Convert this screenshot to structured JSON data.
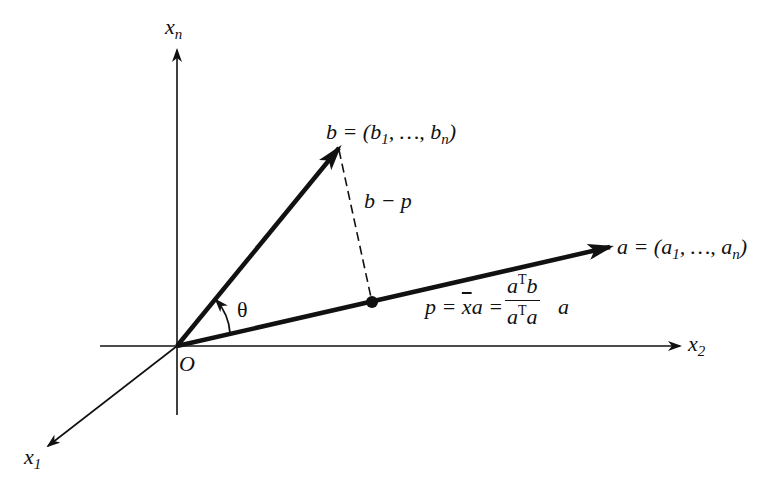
{
  "diagram": {
    "colors": {
      "stroke": "#111111",
      "background": "#ffffff"
    },
    "origin_label": "O",
    "axes": [
      {
        "id": "x1",
        "label": "x",
        "subscript": "1"
      },
      {
        "id": "x2",
        "label": "x",
        "subscript": "2"
      },
      {
        "id": "xn",
        "label": "x",
        "subscript": "n"
      }
    ],
    "vectors": {
      "b": {
        "label": "b = (b",
        "sub1": "1",
        "mid": ", …, b",
        "subn": "n",
        "end": ")"
      },
      "a": {
        "label": "a = (a",
        "sub1": "1",
        "mid": ", …, a",
        "subn": "n",
        "end": ")"
      }
    },
    "error_label": "b − p",
    "angle_label": "θ",
    "projection": {
      "lhs": "p = ",
      "xbar": "x",
      "mid": "a = ",
      "num_a": "a",
      "num_T": "T",
      "num_b": "b",
      "den_a": "a",
      "den_T": "T",
      "den_a2": "a",
      "tail": "a"
    }
  }
}
